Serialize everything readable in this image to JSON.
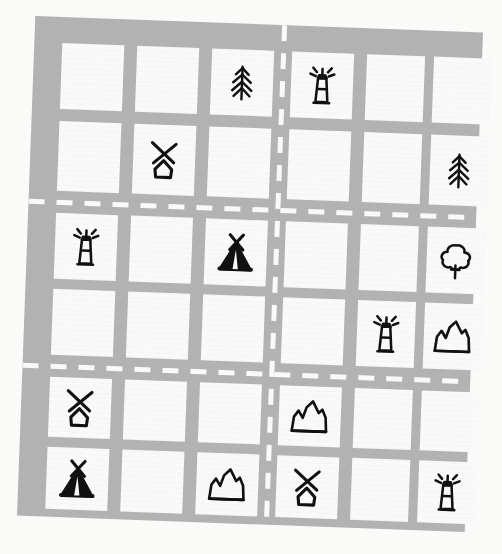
{
  "map": {
    "title": "Hand-drawn town grid map",
    "style": "hand-drawn sketch",
    "rows": 6,
    "cols": 6,
    "rotation_deg": 2.1,
    "colors": {
      "page_background": "#fbfbf9",
      "road": "#b3b3b3",
      "block": "#fafafa",
      "road_marking": "#fafafa",
      "ink": "#111111"
    },
    "legend": [
      {
        "key": "pine-tree",
        "label": "Pine tree"
      },
      {
        "key": "lighthouse",
        "label": "Lighthouse"
      },
      {
        "key": "windmill",
        "label": "Windmill"
      },
      {
        "key": "teepee",
        "label": "Teepee"
      },
      {
        "key": "mountain",
        "label": "Mountain"
      },
      {
        "key": "round-tree",
        "label": "Round tree"
      },
      {
        "key": "empty",
        "label": "Empty block"
      }
    ],
    "roads": {
      "major_horizontal_after_rows": [
        2,
        4
      ],
      "major_vertical_after_cols": [
        3
      ],
      "marking_style": "dashed white centre line"
    },
    "cells": [
      {
        "row": 1,
        "col": 1,
        "icon": "empty"
      },
      {
        "row": 1,
        "col": 2,
        "icon": "empty"
      },
      {
        "row": 1,
        "col": 3,
        "icon": "pine-tree"
      },
      {
        "row": 1,
        "col": 4,
        "icon": "lighthouse"
      },
      {
        "row": 1,
        "col": 5,
        "icon": "empty"
      },
      {
        "row": 1,
        "col": 6,
        "icon": "empty"
      },
      {
        "row": 2,
        "col": 1,
        "icon": "empty"
      },
      {
        "row": 2,
        "col": 2,
        "icon": "windmill"
      },
      {
        "row": 2,
        "col": 3,
        "icon": "empty"
      },
      {
        "row": 2,
        "col": 4,
        "icon": "empty"
      },
      {
        "row": 2,
        "col": 5,
        "icon": "empty"
      },
      {
        "row": 2,
        "col": 6,
        "icon": "pine-tree"
      },
      {
        "row": 3,
        "col": 1,
        "icon": "lighthouse"
      },
      {
        "row": 3,
        "col": 2,
        "icon": "empty"
      },
      {
        "row": 3,
        "col": 3,
        "icon": "teepee"
      },
      {
        "row": 3,
        "col": 4,
        "icon": "empty"
      },
      {
        "row": 3,
        "col": 5,
        "icon": "empty"
      },
      {
        "row": 3,
        "col": 6,
        "icon": "round-tree"
      },
      {
        "row": 4,
        "col": 1,
        "icon": "empty"
      },
      {
        "row": 4,
        "col": 2,
        "icon": "empty"
      },
      {
        "row": 4,
        "col": 3,
        "icon": "empty"
      },
      {
        "row": 4,
        "col": 4,
        "icon": "empty"
      },
      {
        "row": 4,
        "col": 5,
        "icon": "lighthouse"
      },
      {
        "row": 4,
        "col": 6,
        "icon": "mountain"
      },
      {
        "row": 5,
        "col": 1,
        "icon": "windmill"
      },
      {
        "row": 5,
        "col": 2,
        "icon": "empty"
      },
      {
        "row": 5,
        "col": 3,
        "icon": "empty"
      },
      {
        "row": 5,
        "col": 4,
        "icon": "mountain"
      },
      {
        "row": 5,
        "col": 5,
        "icon": "empty"
      },
      {
        "row": 5,
        "col": 6,
        "icon": "empty"
      },
      {
        "row": 6,
        "col": 1,
        "icon": "teepee"
      },
      {
        "row": 6,
        "col": 2,
        "icon": "empty"
      },
      {
        "row": 6,
        "col": 3,
        "icon": "mountain"
      },
      {
        "row": 6,
        "col": 4,
        "icon": "windmill"
      },
      {
        "row": 6,
        "col": 5,
        "icon": "empty"
      },
      {
        "row": 6,
        "col": 6,
        "icon": "lighthouse"
      }
    ]
  }
}
